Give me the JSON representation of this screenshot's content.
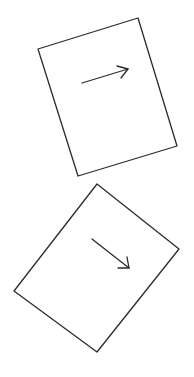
{
  "canvas": {
    "width": 194,
    "height": 377,
    "background": "#ffffff",
    "stroke_color": "#2b2b2b"
  },
  "shapes": [
    {
      "type": "rotated-rectangle",
      "label": "page-1",
      "corners": [
        [
          38,
          49
        ],
        [
          138,
          18
        ],
        [
          177,
          146
        ],
        [
          78,
          176
        ]
      ],
      "arrow": {
        "from": [
          82,
          83
        ],
        "to": [
          128,
          69
        ],
        "direction": "right"
      }
    },
    {
      "type": "rotated-rectangle",
      "label": "page-2",
      "corners": [
        [
          97,
          184
        ],
        [
          179,
          249
        ],
        [
          97,
          352
        ],
        [
          14,
          291
        ]
      ],
      "arrow": {
        "from": [
          92,
          239
        ],
        "to": [
          129,
          268
        ],
        "direction": "down-right"
      }
    }
  ]
}
